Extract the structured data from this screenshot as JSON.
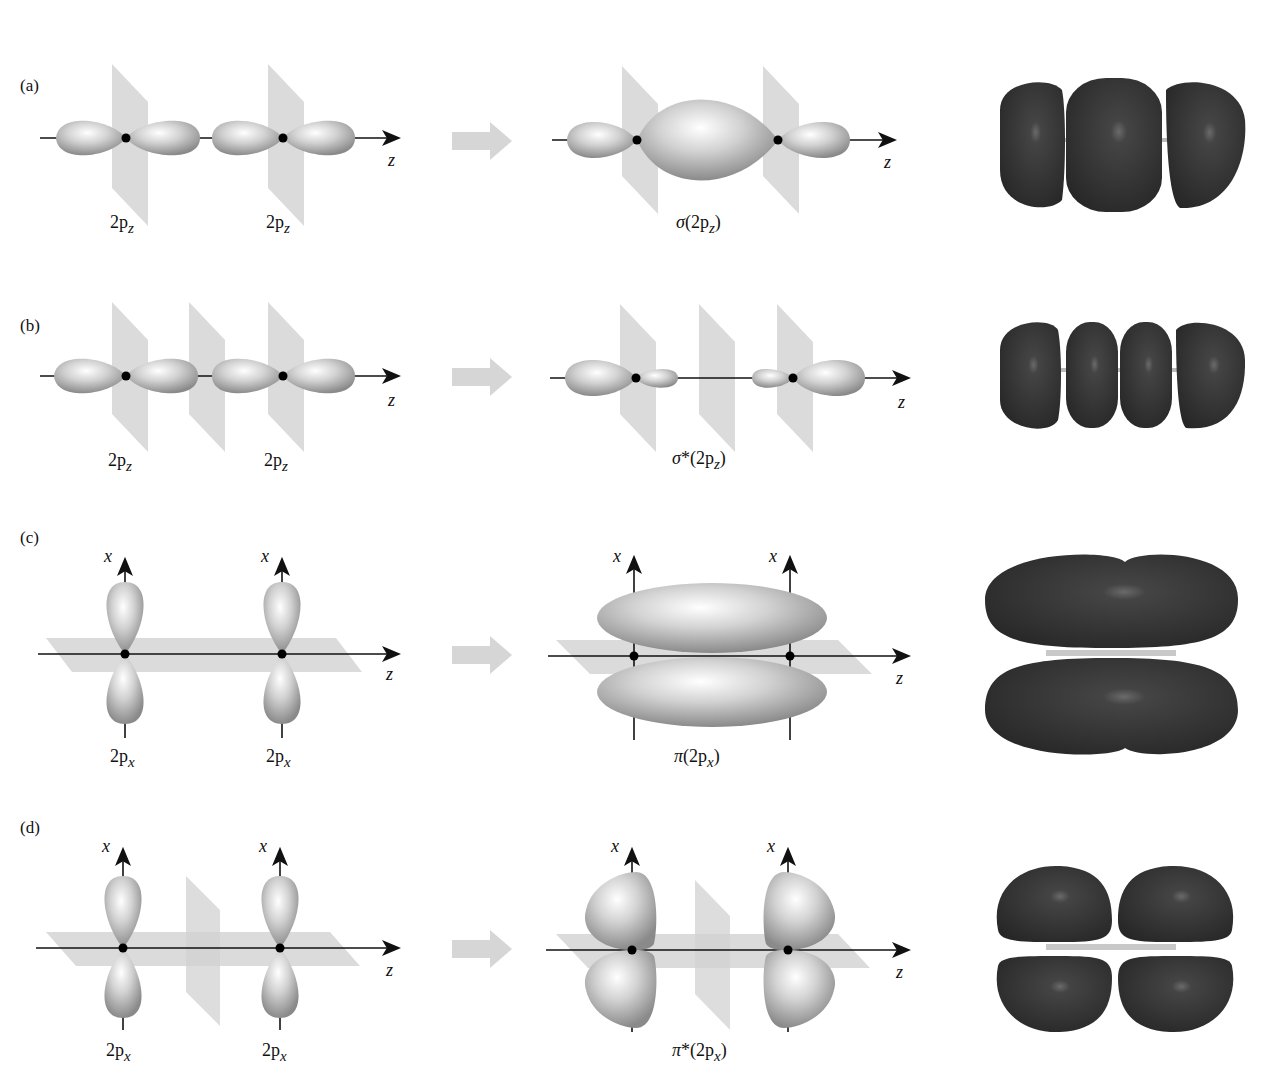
{
  "figure": {
    "caption_fragment": "",
    "rows": [
      {
        "panel": "(a)",
        "left_labels": [
          "2p",
          "z",
          "2p",
          "z"
        ],
        "atomic_orbital": "2p_z",
        "result_label_prefix": "σ",
        "result_label_star": "",
        "result_label_open": "(2p",
        "result_label_sub": "z",
        "result_label_close": ")",
        "axis_label": "z"
      },
      {
        "panel": "(b)",
        "atomic_orbital": "2p_z",
        "result_label_prefix": "σ",
        "result_label_star": "*",
        "result_label_open": "(2p",
        "result_label_sub": "z",
        "result_label_close": ")",
        "axis_label": "z"
      },
      {
        "panel": "(c)",
        "atomic_orbital": "2p_x",
        "result_label_prefix": "π",
        "result_label_star": "",
        "result_label_open": "(2p",
        "result_label_sub": "x",
        "result_label_close": ")",
        "axis_label": "z",
        "vertical_axis_label": "x"
      },
      {
        "panel": "(d)",
        "atomic_orbital": "2p_x",
        "result_label_prefix": "π",
        "result_label_star": "*",
        "result_label_open": "(2p",
        "result_label_sub": "x",
        "result_label_close": ")",
        "axis_label": "z",
        "vertical_axis_label": "x"
      }
    ],
    "ao_label_main": "2p",
    "colors": {
      "lobe_light": "#f4f4f4",
      "lobe_dark": "#8c8c8c",
      "plane": "#c8c8c8",
      "arrow": "#d6d6d6",
      "isosurface": "#3a3a3a"
    }
  }
}
